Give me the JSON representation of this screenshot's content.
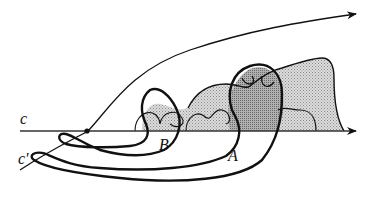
{
  "figure": {
    "labels": {
      "c": "c",
      "c_prime": "c'",
      "A": "A",
      "B": "B"
    },
    "colors": {
      "stroke": "#111111",
      "shade_light": "#c8c8c8",
      "shade_dark": "#9a9a9a",
      "background": "#ffffff"
    }
  }
}
